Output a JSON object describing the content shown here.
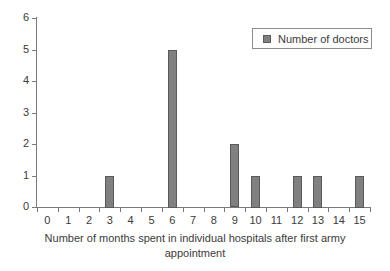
{
  "chart_data": {
    "type": "bar",
    "title": "",
    "subtitle": "",
    "xlabel": "Number of months spent in individual hospitals after first army appointment",
    "ylabel": "",
    "categories": [
      "0",
      "1",
      "2",
      "3",
      "4",
      "5",
      "6",
      "7",
      "8",
      "9",
      "10",
      "11",
      "12",
      "13",
      "14",
      "15"
    ],
    "series": [
      {
        "name": "Number of doctors",
        "values": [
          0,
          0,
          0,
          1,
          0,
          0,
          5,
          0,
          0,
          2,
          1,
          0,
          1,
          1,
          0,
          1
        ],
        "color": "#808080"
      }
    ],
    "ylim": [
      0,
      6
    ],
    "yticks": [
      "0",
      "1",
      "2",
      "3",
      "4",
      "5",
      "6"
    ],
    "grid": false,
    "legend_position": "top-right"
  },
  "axes": {
    "y_tick_labels": [
      "6",
      "5",
      "4",
      "3",
      "2",
      "1",
      "0"
    ],
    "x_tick_labels": [
      "0",
      "1",
      "2",
      "3",
      "4",
      "5",
      "6",
      "7",
      "8",
      "9",
      "10",
      "11",
      "12",
      "13",
      "14",
      "15"
    ],
    "x_title_line1": "Number of months spent in individual hospitals after first army",
    "x_title_line2": "appointment"
  },
  "legend": {
    "entries": [
      {
        "label": "Number of doctors",
        "swatch_color": "#808080"
      }
    ]
  },
  "style": {
    "background": "#ffffff",
    "axis_color": "#7a7a7a",
    "bar_fill": "#808080",
    "bar_border": "#5a5a5a",
    "text_color": "#3b3b3b"
  }
}
